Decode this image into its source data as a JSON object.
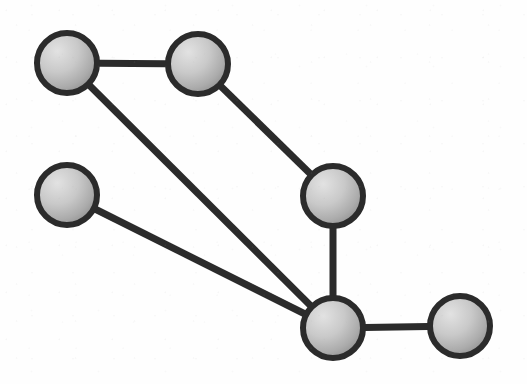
{
  "figure": {
    "kind": "graph-diagram",
    "width": 527,
    "height": 384,
    "background_color": "#fefefe",
    "node_stroke_color": "#2b2b2b",
    "node_fill_light": "#d8d8d8",
    "node_fill_dark": "#969696",
    "edge_color": "#2b2b2b",
    "node_radius": 33,
    "node_ring_width": 6,
    "edge_width": 7
  },
  "chart_data": {
    "type": "graph",
    "title": "",
    "xlabel": "",
    "ylabel": "",
    "directed": false,
    "node_count": 6,
    "edge_count": 6,
    "nodes": [
      {
        "id": "n1",
        "label": "",
        "x": 67,
        "y": 63,
        "r": 33,
        "degree": 2
      },
      {
        "id": "n2",
        "label": "",
        "x": 198,
        "y": 64,
        "r": 33,
        "degree": 2
      },
      {
        "id": "n3",
        "label": "",
        "x": 67,
        "y": 195,
        "r": 33,
        "degree": 1
      },
      {
        "id": "n4",
        "label": "",
        "x": 333,
        "y": 196,
        "r": 33,
        "degree": 2
      },
      {
        "id": "n5",
        "label": "",
        "x": 333,
        "y": 328,
        "r": 33,
        "degree": 4
      },
      {
        "id": "n6",
        "label": "",
        "x": 460,
        "y": 326,
        "r": 33,
        "degree": 1
      }
    ],
    "edges": [
      {
        "id": "e1",
        "source": "n1",
        "target": "n2",
        "label": ""
      },
      {
        "id": "e2",
        "source": "n1",
        "target": "n5",
        "label": ""
      },
      {
        "id": "e3",
        "source": "n2",
        "target": "n4",
        "label": ""
      },
      {
        "id": "e4",
        "source": "n3",
        "target": "n5",
        "label": ""
      },
      {
        "id": "e5",
        "source": "n4",
        "target": "n5",
        "label": ""
      },
      {
        "id": "e6",
        "source": "n5",
        "target": "n6",
        "label": ""
      }
    ]
  }
}
